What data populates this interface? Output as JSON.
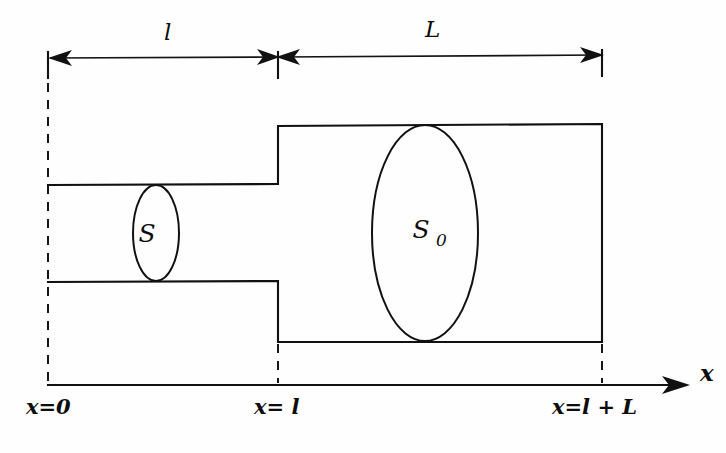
{
  "figure": {
    "kind": "technical-line-diagram",
    "background_color": "#fefefe",
    "ink_color": "#111111"
  },
  "dimensions": {
    "neck_label": "l",
    "chamber_label": "L"
  },
  "areas": {
    "neck_area_label": "S",
    "chamber_area_symbol": "S",
    "chamber_area_subscript": "0"
  },
  "axis": {
    "name": "x",
    "ticks": [
      {
        "id": "origin",
        "label": "x=0"
      },
      {
        "id": "junction",
        "label": "x= l"
      },
      {
        "id": "end",
        "label": "x=l + L"
      }
    ]
  },
  "geometry": {
    "left_wall_x": 48,
    "junction_x": 278,
    "right_wall_x": 602,
    "neck_top_y": 185,
    "neck_bottom_y": 281,
    "chamber_top_y": 125,
    "chamber_bottom_y": 342,
    "dimension_line_y": 58,
    "axis_y": 385,
    "axis_arrow_tip_x": 688,
    "neck_ellipse_cx": 156,
    "neck_ellipse_rx": 23,
    "chamber_ellipse_cx": 425,
    "chamber_ellipse_rx": 53
  }
}
